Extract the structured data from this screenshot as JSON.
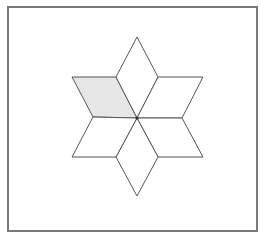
{
  "figure": {
    "shape_count": 6,
    "shaded_count": 1,
    "shaded_position": "upper-left",
    "colors": {
      "frame": "#7a7a7a",
      "stroke": "#555555",
      "shade": "#e6e6e6",
      "fill": "#ffffff"
    }
  }
}
